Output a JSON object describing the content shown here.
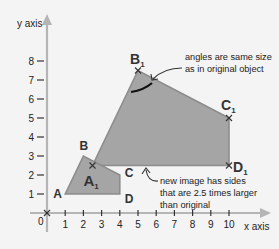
{
  "diagram": {
    "x_axis_label": "x axis",
    "y_axis_label": "y axis",
    "origin_label": "0",
    "x_ticks": [
      "1",
      "2",
      "3",
      "4",
      "5",
      "6",
      "7",
      "8",
      "9",
      "10"
    ],
    "y_ticks": [
      "1",
      "2",
      "3",
      "4",
      "5",
      "6",
      "7",
      "8"
    ],
    "scale_factor": 2.5,
    "original_shape": {
      "name": "ABCD",
      "vertices": [
        {
          "label": "A",
          "sub": "",
          "x": 1,
          "y": 1
        },
        {
          "label": "B",
          "sub": "",
          "x": 2,
          "y": 3
        },
        {
          "label": "C",
          "sub": "",
          "x": 4,
          "y": 2
        },
        {
          "label": "D",
          "sub": "",
          "x": 4,
          "y": 1
        }
      ]
    },
    "image_shape": {
      "name": "A1B1C1D1",
      "vertices": [
        {
          "label": "A",
          "sub": "1",
          "x": 2.5,
          "y": 2.5
        },
        {
          "label": "B",
          "sub": "1",
          "x": 5,
          "y": 7.5
        },
        {
          "label": "C",
          "sub": "1",
          "x": 10,
          "y": 5
        },
        {
          "label": "D",
          "sub": "1",
          "x": 10,
          "y": 2.5
        }
      ]
    },
    "annotations": {
      "angles_note": [
        "angles are same size",
        "as in original object"
      ],
      "sides_note": [
        "new image has sides",
        "that are 2.5 times larger",
        "than original"
      ]
    },
    "colors": {
      "shape_fill": "#a5a5a5",
      "shape_stroke": "#8c8c8c",
      "axis": "#b5b5b5",
      "background": "#f4f4f4"
    }
  }
}
